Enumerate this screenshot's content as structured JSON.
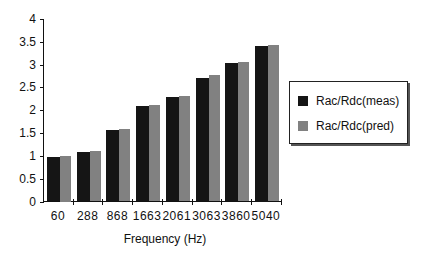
{
  "chart_data": {
    "type": "bar",
    "title": "",
    "xlabel": "Frequency  (Hz)",
    "ylabel": "",
    "ylim": [
      0,
      4
    ],
    "yticks": [
      "0",
      "0.5",
      "1",
      "1.5",
      "2",
      "2.5",
      "3",
      "3.5",
      "4"
    ],
    "categories": [
      "60",
      "288",
      "868",
      "1663",
      "2061",
      "3063",
      "3860",
      "5040"
    ],
    "series": [
      {
        "name": "Rac/Rdc(meas)",
        "values": [
          0.98,
          1.09,
          1.56,
          2.09,
          2.28,
          2.71,
          3.03,
          3.4
        ]
      },
      {
        "name": "Rac/Rdc(pred)",
        "values": [
          1.0,
          1.11,
          1.59,
          2.12,
          2.32,
          2.77,
          3.06,
          3.44
        ]
      }
    ],
    "legend_position": "right",
    "grid": false
  },
  "legend": {
    "items": [
      "Rac/Rdc(meas)",
      "Rac/Rdc(pred)"
    ]
  }
}
